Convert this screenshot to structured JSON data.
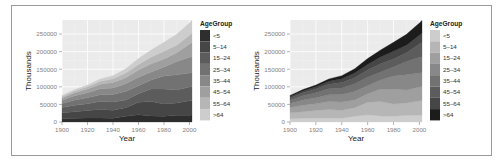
{
  "chart_data": [
    {
      "type": "area",
      "stacked": true,
      "title": "",
      "xlabel": "Year",
      "ylabel": "Thousands",
      "xlim": [
        1900,
        2002
      ],
      "ylim": [
        0,
        290000
      ],
      "x_ticks": [
        1900,
        1920,
        1940,
        1960,
        1980,
        2000
      ],
      "y_ticks": [
        0,
        50000,
        100000,
        150000,
        200000,
        250000
      ],
      "y_tick_labels": [
        "0",
        "50000",
        "100000",
        "150000",
        "200000",
        "250000"
      ],
      "grid": true,
      "legend": {
        "title": "AgeGroup",
        "position": "right",
        "entries": [
          "<5",
          "5-14",
          "15-24",
          "25-34",
          "35-44",
          "45-54",
          "55-64",
          ">64"
        ]
      },
      "palette": "dark-to-light",
      "colors": [
        "#2e2e2e",
        "#464646",
        "#5c5c5c",
        "#727272",
        "#888888",
        "#9f9f9f",
        "#b6b6b6",
        "#cdcdcd"
      ],
      "x": [
        1900,
        1910,
        1920,
        1930,
        1940,
        1950,
        1960,
        1970,
        1980,
        1990,
        2000,
        2002
      ],
      "series": [
        {
          "name": "<5",
          "values": [
            9200,
            10600,
            11600,
            11400,
            10600,
            16400,
            20300,
            17200,
            16500,
            18900,
            19200,
            19600
          ]
        },
        {
          "name": "5-14",
          "values": [
            16800,
            18600,
            21300,
            24400,
            22500,
            24300,
            35500,
            40800,
            34900,
            35100,
            40900,
            41000
          ]
        },
        {
          "name": "15-24",
          "values": [
            14900,
            18400,
            18700,
            22500,
            24000,
            22100,
            24600,
            36000,
            42500,
            37000,
            39100,
            40400
          ]
        },
        {
          "name": "25-34",
          "values": [
            12000,
            15300,
            17000,
            18900,
            21300,
            24000,
            22900,
            25300,
            37100,
            43200,
            39900,
            39900
          ]
        },
        {
          "name": "35-44",
          "values": [
            9000,
            11900,
            14400,
            17200,
            18300,
            21600,
            24200,
            23200,
            25600,
            37600,
            45200,
            44500
          ]
        },
        {
          "name": "45-54",
          "values": [
            6500,
            8500,
            10500,
            13000,
            15500,
            17400,
            20600,
            23300,
            22800,
            25200,
            37700,
            40100
          ]
        },
        {
          "name": "55-64",
          "values": [
            4000,
            5100,
            6500,
            8400,
            10600,
            13300,
            15600,
            18700,
            21700,
            21100,
            24300,
            27300
          ]
        },
        {
          "name": ">64",
          "values": [
            3100,
            4000,
            4900,
            6600,
            9000,
            12300,
            16600,
            20100,
            25600,
            31200,
            35000,
            35600
          ]
        }
      ]
    },
    {
      "type": "area",
      "stacked": true,
      "title": "",
      "xlabel": "Year",
      "ylabel": "Thousands",
      "xlim": [
        1900,
        2002
      ],
      "ylim": [
        0,
        290000
      ],
      "x_ticks": [
        1900,
        1920,
        1940,
        1960,
        1980,
        2000
      ],
      "y_ticks": [
        0,
        50000,
        100000,
        150000,
        200000,
        250000
      ],
      "y_tick_labels": [
        "0",
        "50000",
        "100000",
        "150000",
        "200000",
        "250000"
      ],
      "grid": true,
      "legend": {
        "title": "AgeGroup",
        "position": "right",
        "entries": [
          "<5",
          "5-14",
          "15-24",
          "25-34",
          "35-44",
          "45-54",
          "55-64",
          ">64"
        ]
      },
      "palette": "light-to-dark",
      "colors": [
        "#cdcdcd",
        "#b6b6b6",
        "#9f9f9f",
        "#888888",
        "#727272",
        "#5c5c5c",
        "#464646",
        "#1c1c1c"
      ],
      "x": [
        1900,
        1910,
        1920,
        1930,
        1940,
        1950,
        1960,
        1970,
        1980,
        1990,
        2000,
        2002
      ],
      "series": [
        {
          "name": "<5",
          "values": [
            9200,
            10600,
            11600,
            11400,
            10600,
            16400,
            20300,
            17200,
            16500,
            18900,
            19200,
            19600
          ]
        },
        {
          "name": "5-14",
          "values": [
            16800,
            18600,
            21300,
            24400,
            22500,
            24300,
            35500,
            40800,
            34900,
            35100,
            40900,
            41000
          ]
        },
        {
          "name": "15-24",
          "values": [
            14900,
            18400,
            18700,
            22500,
            24000,
            22100,
            24600,
            36000,
            42500,
            37000,
            39100,
            40400
          ]
        },
        {
          "name": "25-34",
          "values": [
            12000,
            15300,
            17000,
            18900,
            21300,
            24000,
            22900,
            25300,
            37100,
            43200,
            39900,
            39900
          ]
        },
        {
          "name": "35-44",
          "values": [
            9000,
            11900,
            14400,
            17200,
            18300,
            21600,
            24200,
            23200,
            25600,
            37600,
            45200,
            44500
          ]
        },
        {
          "name": "45-54",
          "values": [
            6500,
            8500,
            10500,
            13000,
            15500,
            17400,
            20600,
            23300,
            22800,
            25200,
            37700,
            40100
          ]
        },
        {
          "name": "55-64",
          "values": [
            4000,
            5100,
            6500,
            8400,
            10600,
            13300,
            15600,
            18700,
            21700,
            21100,
            24300,
            27300
          ]
        },
        {
          "name": ">64",
          "values": [
            3100,
            4000,
            4900,
            6600,
            9000,
            12300,
            16600,
            20100,
            25600,
            31200,
            35000,
            35600
          ]
        }
      ]
    }
  ]
}
